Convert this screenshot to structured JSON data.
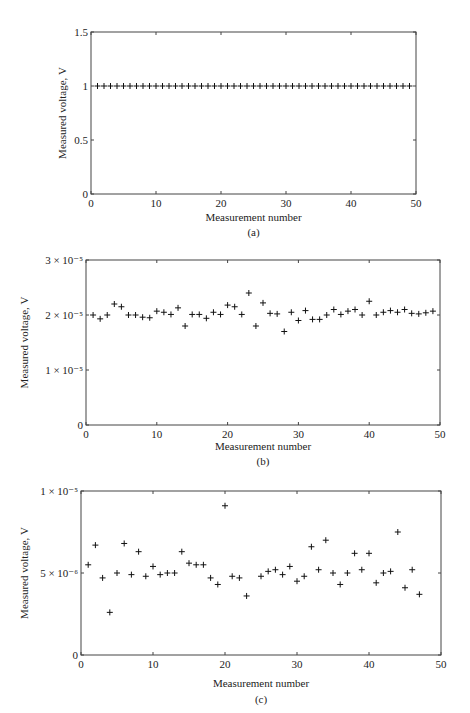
{
  "chart_data": [
    {
      "id": "a",
      "type": "scatter",
      "marker": "+",
      "caption": "(a)",
      "title": "",
      "xlabel": "Measurement number",
      "ylabel": "Measured voltage, V",
      "xlim": [
        0,
        50
      ],
      "ylim": [
        0,
        1.5
      ],
      "xticks": [
        0,
        10,
        20,
        30,
        40,
        50
      ],
      "xtick_labels": [
        "0",
        "10",
        "20",
        "30",
        "40",
        "50"
      ],
      "yticks": [
        0,
        0.5,
        1,
        1.5
      ],
      "ytick_labels": [
        "0",
        "0.5",
        "1",
        "1.5"
      ],
      "grid": false,
      "x": [
        1,
        2,
        3,
        4,
        5,
        6,
        7,
        8,
        9,
        10,
        11,
        12,
        13,
        14,
        15,
        16,
        17,
        18,
        19,
        20,
        21,
        22,
        23,
        24,
        25,
        26,
        27,
        28,
        29,
        30,
        31,
        32,
        33,
        34,
        35,
        36,
        37,
        38,
        39,
        40,
        41,
        42,
        43,
        44,
        45,
        46,
        47,
        48,
        49
      ],
      "y": [
        1,
        1,
        1,
        1,
        1,
        1,
        1,
        1,
        1,
        1,
        1,
        1,
        1,
        1,
        1,
        1,
        1,
        1,
        1,
        1,
        1,
        1,
        1,
        1,
        1,
        1,
        1,
        1,
        1,
        1,
        1,
        1,
        1,
        1,
        1,
        1,
        1,
        1,
        1,
        1,
        1,
        1,
        1,
        1,
        1,
        1,
        1,
        1,
        1
      ]
    },
    {
      "id": "b",
      "type": "scatter",
      "marker": "+",
      "caption": "(b)",
      "title": "",
      "xlabel": "Measurement number",
      "ylabel": "Measured voltage, V",
      "xlim": [
        0,
        50
      ],
      "ylim": [
        0,
        3e-05
      ],
      "xticks": [
        0,
        10,
        20,
        30,
        40,
        50
      ],
      "xtick_labels": [
        "0",
        "10",
        "20",
        "30",
        "40",
        "50"
      ],
      "yticks": [
        0,
        1e-05,
        2e-05,
        3e-05
      ],
      "ytick_labels": [
        "0",
        "1 × 10⁻⁵",
        "2 × 10⁻⁵",
        "3 × 10⁻⁵"
      ],
      "grid": false,
      "x": [
        1,
        2,
        3,
        4,
        5,
        6,
        7,
        8,
        9,
        10,
        11,
        12,
        13,
        14,
        15,
        16,
        17,
        18,
        19,
        20,
        21,
        22,
        23,
        24,
        25,
        26,
        27,
        28,
        29,
        30,
        31,
        32,
        33,
        34,
        35,
        36,
        37,
        38,
        39,
        40,
        41,
        42,
        43,
        44,
        45,
        46,
        47,
        48,
        49
      ],
      "y": [
        2e-05,
        1.93e-05,
        2e-05,
        2.2e-05,
        2.15e-05,
        2e-05,
        2e-05,
        1.96e-05,
        1.95e-05,
        2.07e-05,
        2.05e-05,
        2.01e-05,
        2.13e-05,
        1.8e-05,
        2.01e-05,
        2.01e-05,
        1.94e-05,
        2.05e-05,
        2.01e-05,
        2.18e-05,
        2.15e-05,
        2.01e-05,
        2.4e-05,
        1.8e-05,
        2.22e-05,
        2.03e-05,
        2.02e-05,
        1.7e-05,
        2.05e-05,
        1.9e-05,
        2.08e-05,
        1.92e-05,
        1.92e-05,
        2e-05,
        2.1e-05,
        2.01e-05,
        2.07e-05,
        2.1e-05,
        2e-05,
        2.25e-05,
        2e-05,
        2.05e-05,
        2.08e-05,
        2.05e-05,
        2.1e-05,
        2.03e-05,
        2.02e-05,
        2.04e-05,
        2.07e-05
      ]
    },
    {
      "id": "c",
      "type": "scatter",
      "marker": "+",
      "caption": "(c)",
      "title": "",
      "xlabel": "Measurement number",
      "ylabel": "Measured voltage, V",
      "xlim": [
        0,
        50
      ],
      "ylim": [
        0,
        1e-05
      ],
      "xticks": [
        0,
        10,
        20,
        30,
        40,
        50
      ],
      "xtick_labels": [
        "0",
        "10",
        "20",
        "30",
        "40",
        "50"
      ],
      "yticks": [
        0,
        5e-06,
        1e-05
      ],
      "ytick_labels": [
        "0",
        "5 × 10⁻⁶",
        "1 × 10⁻⁵"
      ],
      "grid": false,
      "x": [
        1,
        2,
        3,
        4,
        5,
        6,
        7,
        8,
        9,
        10,
        11,
        12,
        13,
        14,
        15,
        16,
        17,
        18,
        19,
        20,
        21,
        22,
        23,
        25,
        26,
        27,
        28,
        29,
        30,
        31,
        32,
        33,
        34,
        35,
        36,
        37,
        38,
        39,
        40,
        41,
        42,
        43,
        44,
        45,
        46,
        47
      ],
      "y": [
        5.5e-06,
        6.7e-06,
        4.7e-06,
        2.6e-06,
        5e-06,
        6.8e-06,
        4.9e-06,
        6.3e-06,
        4.8e-06,
        5.4e-06,
        4.9e-06,
        5e-06,
        5e-06,
        6.3e-06,
        5.6e-06,
        5.5e-06,
        5.5e-06,
        4.7e-06,
        4.3e-06,
        9.1e-06,
        4.8e-06,
        4.7e-06,
        3.6e-06,
        4.8e-06,
        5.1e-06,
        5.2e-06,
        4.9e-06,
        5.4e-06,
        4.5e-06,
        4.8e-06,
        6.6e-06,
        5.2e-06,
        7e-06,
        5e-06,
        4.3e-06,
        5e-06,
        6.2e-06,
        5.2e-06,
        6.2e-06,
        4.4e-06,
        5e-06,
        5.1e-06,
        7.5e-06,
        4.1e-06,
        5.2e-06,
        3.7e-06
      ]
    }
  ],
  "layout": [
    {
      "top": 0,
      "box": [
        91,
        32,
        416,
        194
      ],
      "xlabel_y": 221,
      "caption_y": 236,
      "ylabel_x": 66
    },
    {
      "top": 0,
      "box": [
        86,
        260,
        440,
        425
      ],
      "xlabel_y": 450,
      "caption_y": 465,
      "ylabel_x": 28
    },
    {
      "top": 0,
      "box": [
        81,
        491,
        441,
        655
      ],
      "xlabel_y": 687,
      "caption_y": 703,
      "ylabel_x": 28
    }
  ]
}
